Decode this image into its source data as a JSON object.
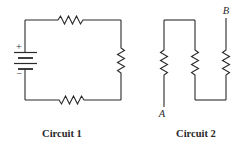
{
  "figure": {
    "circuits": [
      {
        "id": "circuit-1",
        "caption": "Circuit 1",
        "battery": {
          "positive_label": "+",
          "negative_label": "−"
        },
        "resistors": [
          "top",
          "right",
          "bottom"
        ],
        "topology": "series loop with battery"
      },
      {
        "id": "circuit-2",
        "caption": "Circuit 2",
        "terminals": {
          "a": "A",
          "b": "B"
        },
        "resistors": [
          "left",
          "middle",
          "right"
        ],
        "topology": "three resistors in series between A and B"
      }
    ],
    "colors": {
      "line": "#2a2a2a",
      "background": "#ffffff"
    }
  }
}
